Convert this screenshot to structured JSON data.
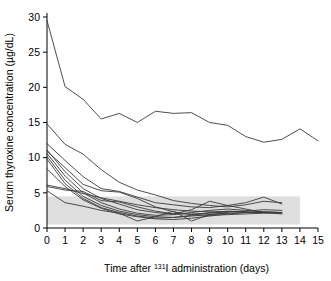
{
  "chart_data": {
    "type": "line",
    "title": "",
    "xlabel": "Time after 131I administration (days)",
    "xlabel_parts": {
      "pre": "Time after ",
      "sup": "131",
      "post": "I administration (days)"
    },
    "ylabel": "Serum thyroxine concentration (µg/dL)",
    "xlim": [
      0,
      15
    ],
    "ylim": [
      0,
      30
    ],
    "xticks": [
      0,
      1,
      2,
      3,
      4,
      5,
      6,
      7,
      8,
      9,
      10,
      11,
      12,
      13,
      14,
      15
    ],
    "yticks": [
      0,
      5,
      10,
      15,
      20,
      25,
      30
    ],
    "grid": false,
    "legend": "none",
    "reference_band": {
      "label": "normal reference range",
      "ymin": 0.5,
      "ymax": 4.5,
      "xmin": 0,
      "xmax": 14,
      "color": "#d8d8d8"
    },
    "line_color": "#3a3a3a",
    "series": [
      {
        "name": "patient-1",
        "x": [
          0,
          1,
          2,
          3,
          4,
          5,
          6,
          7,
          8,
          9,
          10,
          11,
          12,
          13,
          14,
          15
        ],
        "values": [
          29.5,
          20.1,
          18.3,
          15.5,
          16.3,
          15.0,
          16.6,
          16.3,
          16.4,
          15.0,
          14.6,
          13.0,
          12.2,
          12.6,
          14.1,
          12.4
        ]
      },
      {
        "name": "patient-2",
        "x": [
          0,
          1,
          2,
          3,
          4,
          5,
          6,
          7,
          8,
          9,
          10,
          11,
          12,
          13
        ],
        "values": [
          14.8,
          11.9,
          10.5,
          8.3,
          6.5,
          5.4,
          4.7,
          3.9,
          3.5,
          3.2,
          3.0,
          3.3,
          3.8,
          3.6
        ]
      },
      {
        "name": "patient-3",
        "x": [
          0,
          1,
          2,
          3,
          4,
          5,
          6,
          7,
          8,
          9,
          10,
          11,
          12,
          13
        ],
        "values": [
          12.0,
          9.6,
          7.3,
          5.6,
          5.2,
          4.4,
          3.6,
          3.3,
          3.0,
          2.9,
          3.2,
          3.6,
          4.4,
          3.4
        ]
      },
      {
        "name": "patient-4",
        "x": [
          0,
          1,
          2,
          3,
          4,
          5,
          6,
          7,
          8,
          9,
          10,
          11,
          12,
          13
        ],
        "values": [
          11.1,
          8.0,
          5.6,
          4.2,
          3.4,
          2.6,
          2.2,
          2.0,
          2.0,
          2.1,
          2.3,
          2.4,
          2.6,
          2.5
        ]
      },
      {
        "name": "patient-5",
        "x": [
          0,
          1,
          2,
          3,
          4,
          5,
          6,
          7,
          8,
          9,
          10,
          11,
          12,
          13
        ],
        "values": [
          10.6,
          7.4,
          5.0,
          3.6,
          2.7,
          2.1,
          1.8,
          1.9,
          2.2,
          2.5,
          2.7,
          2.5,
          2.3,
          2.2
        ]
      },
      {
        "name": "patient-6",
        "x": [
          0,
          1,
          2,
          3,
          4,
          5,
          6,
          7,
          8,
          9,
          10,
          11,
          12,
          13
        ],
        "values": [
          10.2,
          6.8,
          4.5,
          3.2,
          2.4,
          1.9,
          1.6,
          1.5,
          1.7,
          1.9,
          2.1,
          2.2,
          2.2,
          2.1
        ]
      },
      {
        "name": "patient-7",
        "x": [
          0,
          1,
          2,
          3,
          4,
          5,
          6,
          7,
          8,
          9,
          10,
          11,
          12
        ],
        "values": [
          9.8,
          6.3,
          4.2,
          2.9,
          2.2,
          1.7,
          1.4,
          1.5,
          1.8,
          2.2,
          2.4,
          2.3,
          2.2
        ]
      },
      {
        "name": "patient-8",
        "x": [
          0,
          1,
          2,
          3,
          4,
          5,
          6,
          7,
          8,
          9,
          10,
          11,
          12,
          13
        ],
        "values": [
          8.4,
          5.9,
          4.0,
          2.8,
          2.0,
          1.6,
          1.3,
          1.2,
          1.4,
          1.7,
          2.0,
          2.2,
          2.3,
          2.2
        ]
      },
      {
        "name": "patient-9",
        "x": [
          0,
          1,
          2,
          3,
          4,
          5,
          6,
          7,
          8,
          9,
          10,
          11
        ],
        "values": [
          6.1,
          5.6,
          4.9,
          4.3,
          3.8,
          3.3,
          2.9,
          2.6,
          2.4,
          2.3,
          2.3,
          2.3
        ]
      },
      {
        "name": "patient-10",
        "x": [
          0,
          1,
          2,
          3,
          4,
          5,
          6,
          7,
          8,
          9,
          10,
          11,
          12,
          13
        ],
        "values": [
          5.9,
          5.4,
          5.2,
          3.9,
          3.7,
          3.0,
          2.4,
          2.0,
          2.6,
          3.8,
          3.2,
          2.7,
          2.2,
          2.0
        ]
      },
      {
        "name": "patient-11",
        "x": [
          0,
          1,
          2,
          3,
          4,
          5,
          6,
          7,
          8,
          9,
          10
        ],
        "values": [
          5.3,
          3.6,
          3.1,
          2.5,
          2.1,
          1.0,
          1.6,
          2.4,
          1.0,
          1.9,
          2.2
        ]
      },
      {
        "name": "patient-12",
        "x": [
          0,
          1,
          2,
          3,
          4,
          5,
          6,
          7,
          8,
          9,
          10,
          11,
          12,
          13
        ],
        "values": [
          10.9,
          8.6,
          6.2,
          5.3,
          5.1,
          4.2,
          3.0,
          2.3,
          1.9,
          1.8,
          1.9,
          2.0,
          2.1,
          2.2
        ]
      }
    ]
  }
}
